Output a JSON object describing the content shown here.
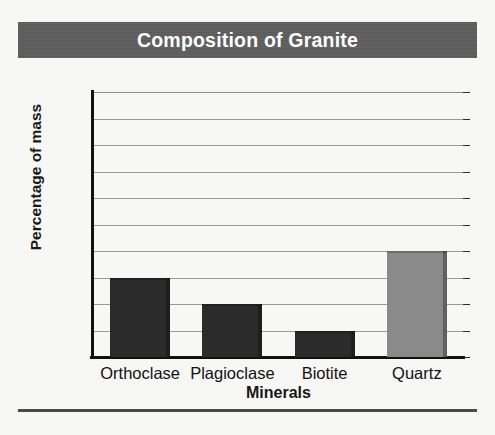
{
  "figure": {
    "background_color": "#f7f7f5",
    "title_band_color": "#5e5e5e",
    "title_text_color": "#ffffff",
    "footer_rule_color": "#4a4a4a"
  },
  "chart_data": {
    "type": "bar",
    "title": "Composition of Granite",
    "xlabel": "Minerals",
    "ylabel": "Percentage of mass",
    "categories": [
      "Orthoclase",
      "Plagioclase",
      "Biotite",
      "Quartz"
    ],
    "values": [
      30,
      20,
      10,
      40
    ],
    "bar_colors": [
      "#2b2b2b",
      "#2b2b2b",
      "#2b2b2b",
      "#8a8a8a"
    ],
    "ylim": [
      0,
      100
    ],
    "ytick_step": 10,
    "ytick_labels": [
      "100",
      "90",
      "80",
      "70",
      "60",
      "50",
      "40",
      "30",
      "20",
      "10",
      "0"
    ],
    "ytick_values": [
      100,
      90,
      80,
      70,
      60,
      50,
      40,
      30,
      20,
      10,
      0
    ],
    "grid": true,
    "grid_axis": "y",
    "grid_color": "#9a9a9a",
    "legend": false,
    "legend_position": "none",
    "axis_color": "#111111",
    "series": [
      {
        "name": "Percentage of mass",
        "values": [
          30,
          20,
          10,
          40
        ]
      }
    ]
  }
}
